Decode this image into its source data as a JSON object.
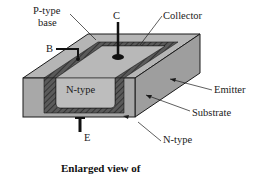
{
  "diagram": {
    "type": "bipolar-transistor-cross-section",
    "labels": {
      "p_type_base_line1": "P-type",
      "p_type_base_line2": "base",
      "collector_terminal": "C",
      "collector": "Collector",
      "base_terminal": "B",
      "n_type_inner": "N-type",
      "emitter": "Emitter",
      "substrate": "Substrate",
      "emitter_terminal": "E",
      "n_type_outer": "N-type"
    },
    "caption": "Enlarged view of",
    "colors": {
      "block_face": "#a9a9a9",
      "block_top": "#b8b8b8",
      "block_side": "#9c9c9c",
      "hatch_region": "#555555",
      "inner_n_type": "#bdbdbd",
      "outline": "#1a1a1a"
    }
  }
}
